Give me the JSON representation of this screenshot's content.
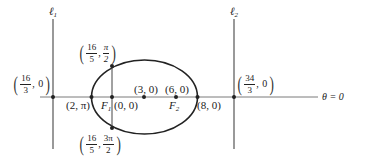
{
  "diagram": {
    "colors": {
      "line": "#555555",
      "curve": "#222222",
      "point": "#222222",
      "text": "#222222"
    },
    "directrices": [
      {
        "name": "ℓ",
        "sub": "1",
        "x_label": {
          "num": "16",
          "den": "3",
          "second": "0"
        }
      },
      {
        "name": "ℓ",
        "sub": "2",
        "x_label": {
          "num": "34",
          "den": "3",
          "second": "0"
        }
      }
    ],
    "polar_axis": {
      "label": "θ = 0"
    },
    "points": {
      "vertex_left": "(2, π)",
      "pole": "(0, 0)",
      "center": "(3, 0)",
      "focus2_coord": "(6, 0)",
      "vertex_right": "(8, 0)",
      "latus_top": {
        "num1": "16",
        "den1": "5",
        "num2": "π",
        "den2": "2"
      },
      "latus_bottom": {
        "num1": "16",
        "den1": "5",
        "num2": "3π",
        "den2": "2"
      }
    },
    "foci": [
      {
        "name": "F",
        "sub": "1"
      },
      {
        "name": "F",
        "sub": "2"
      }
    ]
  }
}
